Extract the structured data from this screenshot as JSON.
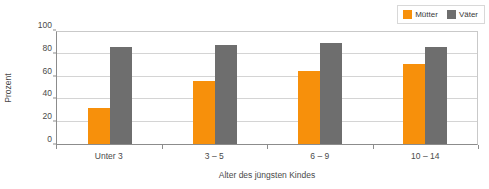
{
  "chart_data": {
    "type": "bar",
    "title": "",
    "subtitle": "",
    "xlabel": "Alter des jüngsten Kindes",
    "ylabel": "Prozent",
    "categories": [
      "Unter 3",
      "3 – 5",
      "6 – 9",
      "10 – 14"
    ],
    "series": [
      {
        "name": "Mütter",
        "color": "#F7900B",
        "values": [
          32,
          55,
          64,
          70
        ]
      },
      {
        "name": "Väter",
        "color": "#6E6E6E",
        "values": [
          85,
          87,
          89,
          85
        ]
      }
    ],
    "ylim": [
      0,
      100
    ],
    "ytick_labels": [
      "0",
      "20",
      "40",
      "60",
      "80",
      "100"
    ],
    "ytick_values": [
      0,
      20,
      40,
      60,
      80,
      100
    ],
    "grid": true,
    "legend_position": "top-right",
    "legend_entries": [
      "Mütter",
      "Väter"
    ],
    "annotations": []
  },
  "legend": {
    "items": [
      {
        "label": "Mütter",
        "swatch": "legend-swatch-muetter"
      },
      {
        "label": "Väter",
        "swatch": "legend-swatch-vaeter"
      }
    ]
  },
  "axes": {
    "y_title": "Prozent",
    "x_title": "Alter des jüngsten Kindes"
  }
}
